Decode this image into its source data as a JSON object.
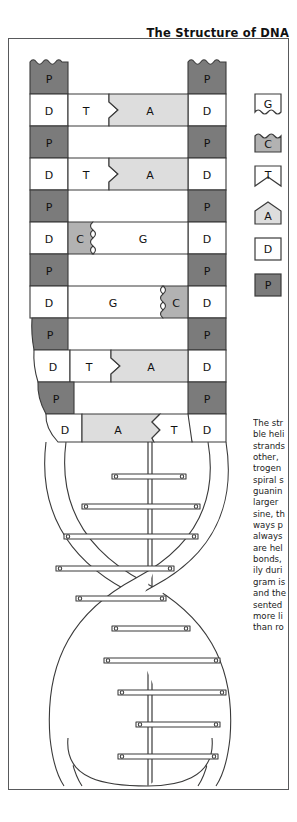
{
  "title": "The Structure of DNA",
  "colors": {
    "phosphate_gray": "#7b7b7b",
    "cytosine_gray": "#b2b2b2",
    "adenine_gray": "#dddddd",
    "white": "#ffffff",
    "stroke": "#3a3a3a",
    "border": "#58595b"
  },
  "legend": {
    "items": [
      {
        "symbol": "G",
        "name": "guanine",
        "shape": "wavy-bottom",
        "fill": "#ffffff"
      },
      {
        "symbol": "C",
        "name": "cytosine",
        "shape": "wavy-top",
        "fill": "#b2b2b2"
      },
      {
        "symbol": "T",
        "name": "thymine",
        "shape": "notch-bottom",
        "fill": "#ffffff"
      },
      {
        "symbol": "A",
        "name": "adenine",
        "shape": "peak-top",
        "fill": "#dddddd"
      },
      {
        "symbol": "D",
        "name": "deoxyribose",
        "shape": "square",
        "fill": "#ffffff"
      },
      {
        "symbol": "P",
        "name": "phosphate",
        "shape": "square",
        "fill": "#7b7b7b"
      }
    ]
  },
  "ladder": {
    "backbone_left_label": "D",
    "backbone_right_label": "D",
    "phosphate_label": "P",
    "rows": [
      {
        "type": "phosphate",
        "left": "P",
        "right": "P",
        "wavy_top": true
      },
      {
        "type": "base_pair",
        "left": "D",
        "right": "D",
        "base_left": "T",
        "base_right": "A",
        "pair": "T-A",
        "joint": "arrow"
      },
      {
        "type": "phosphate",
        "left": "P",
        "right": "P"
      },
      {
        "type": "base_pair",
        "left": "D",
        "right": "D",
        "base_left": "T",
        "base_right": "A",
        "pair": "T-A",
        "joint": "arrow"
      },
      {
        "type": "phosphate",
        "left": "P",
        "right": "P"
      },
      {
        "type": "base_pair",
        "left": "D",
        "right": "D",
        "base_left": "C",
        "base_right": "G",
        "pair": "C-G",
        "joint": "wave"
      },
      {
        "type": "phosphate",
        "left": "P",
        "right": "P"
      },
      {
        "type": "base_pair",
        "left": "D",
        "right": "D",
        "base_left": "G",
        "base_right": "C",
        "pair": "G-C",
        "joint": "wave"
      },
      {
        "type": "phosphate",
        "left": "P",
        "right": "P"
      },
      {
        "type": "base_pair",
        "left": "D",
        "right": "D",
        "base_left": "T",
        "base_right": "A",
        "pair": "T-A",
        "joint": "arrow"
      },
      {
        "type": "phosphate",
        "left": "P",
        "right": "P"
      },
      {
        "type": "base_pair",
        "left": "D",
        "right": "D",
        "base_left": "A",
        "base_right": "T",
        "pair": "A-T",
        "joint": "arrow"
      }
    ]
  },
  "caption": {
    "lines": [
      "The str",
      "ble heli",
      "strands",
      "other, ",
      "trogen",
      "spiral s",
      "guanin",
      "larger ",
      "sine, th",
      "ways p",
      "always",
      "are hel",
      "bonds,",
      "ily duri",
      "gram is",
      "and the",
      "sented",
      "more li",
      "than ro"
    ]
  }
}
